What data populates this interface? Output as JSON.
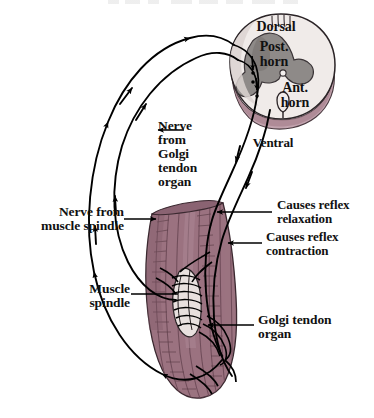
{
  "figure": {
    "title_sliver": "cut-off-text-row",
    "background_color": "#ffffff"
  },
  "colors": {
    "muscle": "#9c7381",
    "muscle_dark": "#6d4a57",
    "muscle_shadow": "#7d5a68",
    "white_matter": "#f0ebe9",
    "grey_matter": "#8e8a88",
    "mauve_band": "#c2a3ae",
    "mauve_band_dark": "#a8838f",
    "nerve": "#000000",
    "text": "#111111",
    "spindle_pale": "#e8e0de"
  },
  "labels": {
    "dorsal": "Dorsal",
    "post_horn": "Post.\nhorn",
    "ant_horn": "Ant.\nhorn",
    "ventral": "Ventral",
    "nerve_from_golgi": "Nerve\nfrom\nGolgi\ntendon\norgan",
    "nerve_from_spindle": "Nerve from\nmuscle spindle",
    "causes_relaxation": "Causes reflex\nrelaxation",
    "causes_contraction": "Causes reflex\ncontraction",
    "muscle_spindle": "Muscle\nspindle",
    "golgi_tendon_organ": "Golgi tendon\norgan"
  },
  "structures": {
    "spinal_cord": "spinal-cord-cross-section",
    "skeletal_muscle": "skeletal-muscle-belly",
    "muscle_spindle_receptor": "muscle-spindle-receptor",
    "golgi_tendon_receptor": "golgi-tendon-organ-receptor",
    "afferent_golgi": "afferent-nerve-golgi",
    "afferent_spindle": "afferent-nerve-spindle",
    "efferent_relaxation": "efferent-nerve-relaxation",
    "efferent_contraction": "efferent-nerve-contraction"
  }
}
